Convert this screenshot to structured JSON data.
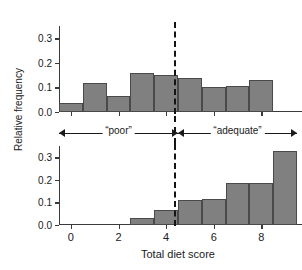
{
  "chart_data": {
    "type": "bar",
    "title": "",
    "xlabel": "Total diet score",
    "ylabel": "Relative frequency",
    "xlim": [
      -0.5,
      9.5
    ],
    "ylim": [
      0.0,
      0.35
    ],
    "grid": false,
    "legend": "none",
    "xticks": [
      0,
      2,
      4,
      6,
      8
    ],
    "xtick_labels": [
      "0",
      "2",
      "4",
      "6",
      "8"
    ],
    "yticks": [
      0.0,
      0.1,
      0.2,
      0.3
    ],
    "ytick_labels": [
      "0.0",
      "0.1",
      "0.2",
      "0.3"
    ],
    "panels": [
      {
        "name": "top-panel",
        "categories": [
          0,
          1,
          2,
          3,
          4,
          5,
          6,
          7,
          8
        ],
        "values": [
          0.035,
          0.12,
          0.065,
          0.16,
          0.15,
          0.14,
          0.1,
          0.105,
          0.13
        ]
      },
      {
        "name": "bottom-panel",
        "categories": [
          0,
          1,
          2,
          3,
          4,
          5,
          6,
          7,
          8,
          9
        ],
        "values": [
          0.0,
          0.0,
          0.0,
          0.03,
          0.065,
          0.11,
          0.115,
          0.185,
          0.185,
          0.33
        ]
      }
    ],
    "annotations": [
      {
        "label": "“poor”",
        "region": [
          -0.5,
          4.5
        ]
      },
      {
        "label": "“adequate”",
        "region": [
          4.5,
          9.5
        ]
      }
    ],
    "divider": {
      "x": 4.5,
      "style": "dashed"
    },
    "colors": {
      "bar_fill": "#808080",
      "bar_edge": "#4a4a4a",
      "axis": "#3a3a3a",
      "text": "#1a1a1a"
    }
  }
}
